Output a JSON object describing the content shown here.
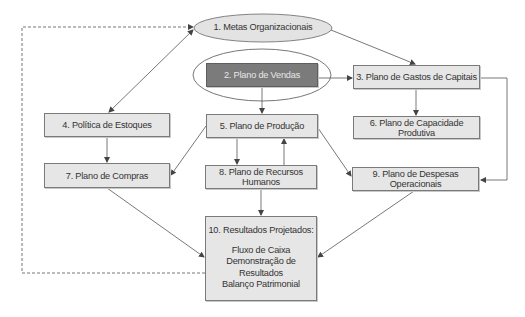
{
  "diagram": {
    "nodes": {
      "n1": {
        "label": "1. Metas Organizacionais",
        "shape": "ellipse"
      },
      "n2": {
        "label": "2. Plano de Vendas",
        "shape": "rect-dark-circled"
      },
      "n3": {
        "label": "3. Plano de Gastos de Capitais",
        "shape": "rect"
      },
      "n4": {
        "label": "4. Política de Estoques",
        "shape": "rect"
      },
      "n5": {
        "label": "5. Plano de Produção",
        "shape": "rect"
      },
      "n6": {
        "label": "6. Plano de Capacidade Produtiva",
        "shape": "rect"
      },
      "n7": {
        "label": "7. Plano de Compras",
        "shape": "rect"
      },
      "n8": {
        "label": "8. Plano de Recursos Humanos",
        "shape": "rect"
      },
      "n9": {
        "label": "9. Plano de Despesas Operacionais",
        "shape": "rect"
      },
      "n10": {
        "title": "10. Resultados Projetados:",
        "lines": [
          "Fluxo de Caixa",
          "Demonstração de Resultados",
          "Balanço Patrimonial"
        ],
        "shape": "rect"
      }
    },
    "edges": [
      {
        "from": "n1",
        "to": "n4",
        "style": "solid",
        "bidirectional": true
      },
      {
        "from": "n1",
        "to": "n3",
        "style": "solid"
      },
      {
        "from": "n2",
        "to": "n3",
        "style": "solid"
      },
      {
        "from": "n2",
        "to": "n5",
        "style": "solid"
      },
      {
        "from": "n3",
        "to": "n6",
        "style": "solid"
      },
      {
        "from": "n3",
        "to": "n9",
        "style": "solid",
        "routing": "elbow-right"
      },
      {
        "from": "n4",
        "to": "n7",
        "style": "solid"
      },
      {
        "from": "n5",
        "to": "n7",
        "style": "solid"
      },
      {
        "from": "n5",
        "to": "n8",
        "style": "solid"
      },
      {
        "from": "n8",
        "to": "n5",
        "style": "solid"
      },
      {
        "from": "n5",
        "to": "n9",
        "style": "solid"
      },
      {
        "from": "n8",
        "to": "n10",
        "style": "solid"
      },
      {
        "from": "n7",
        "to": "n10",
        "style": "solid"
      },
      {
        "from": "n9",
        "to": "n10",
        "style": "solid"
      },
      {
        "from": "n10",
        "to": "n1",
        "style": "dashed",
        "routing": "feedback-loop-left"
      }
    ],
    "colors": {
      "box_fill": "#e6e6e6",
      "box_border": "#7a7a7a",
      "highlight_fill": "#7b7b7b",
      "highlight_text": "#e8e8e8",
      "line": "#555555",
      "ellipse_fill": "#e3e3e3"
    }
  }
}
